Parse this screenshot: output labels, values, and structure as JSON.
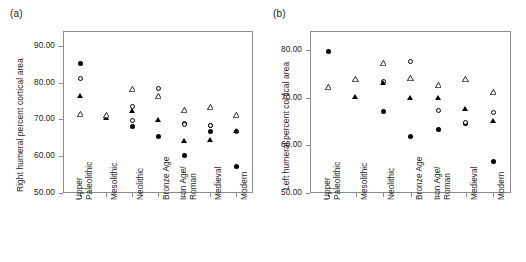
{
  "figure": {
    "panels": [
      {
        "id": "a",
        "label": "(a)",
        "ylabel": "Right humeral percent cortical area"
      },
      {
        "id": "b",
        "label": "(b)",
        "ylabel": "Left humeral percent cortical area"
      }
    ]
  },
  "chart_data": [
    {
      "type": "scatter",
      "panel": "a",
      "title": "(a)",
      "xlabel": "",
      "ylabel": "Right humeral percent cortical area",
      "ylim": [
        50.0,
        94.0
      ],
      "yticks": [
        50.0,
        60.0,
        70.0,
        80.0,
        90.0
      ],
      "ytick_labels": [
        "50.00",
        "60.00",
        "70.00",
        "80.00",
        "90.00"
      ],
      "grid": false,
      "legend": "none",
      "categories": [
        "Upper Paleolithic",
        "Mesolithic",
        "Neolithic",
        "Bronze Age",
        "Iron Age/ Roman",
        "Medieval",
        "Modern"
      ],
      "series": [
        {
          "name": "filled-circle",
          "marker": "filled-circle",
          "values": [
            85.1,
            null,
            68.0,
            65.3,
            60.1,
            66.8,
            57.2
          ]
        },
        {
          "name": "open-circle",
          "marker": "open-circle",
          "values": [
            81.1,
            null,
            69.8,
            78.3,
            68.9,
            68.2,
            66.6
          ]
        },
        {
          "name": "filled-triangle",
          "marker": "filled-triangle",
          "values": [
            76.2,
            70.3,
            72.3,
            69.7,
            64.2,
            64.3,
            66.8
          ]
        },
        {
          "name": "open-triangle",
          "marker": "open-triangle",
          "values": [
            71.3,
            71.1,
            78.1,
            76.3,
            72.4,
            73.2,
            71.1
          ]
        },
        {
          "name": "open-circle-secondary",
          "marker": "open-circle",
          "values": [
            null,
            null,
            73.4,
            null,
            68.6,
            68.3,
            null
          ]
        }
      ]
    },
    {
      "type": "scatter",
      "panel": "b",
      "title": "(b)",
      "xlabel": "",
      "ylabel": "Left humeral percent cortical area",
      "ylim": [
        50.0,
        84.0
      ],
      "yticks": [
        50.0,
        60.0,
        70.0,
        80.0
      ],
      "ytick_labels": [
        "50.00",
        "60.00",
        "70.00",
        "80.00"
      ],
      "grid": false,
      "legend": "none",
      "categories": [
        "Upper Paleolithic",
        "Mesolithic",
        "Neolithic",
        "Bronze Age",
        "Iron Age/ Roman",
        "Medieval",
        "Modern"
      ],
      "series": [
        {
          "name": "filled-circle",
          "marker": "filled-circle",
          "values": [
            79.8,
            null,
            67.2,
            61.8,
            63.4,
            64.5,
            56.7
          ]
        },
        {
          "name": "open-circle",
          "marker": "open-circle",
          "values": [
            null,
            null,
            73.5,
            77.5,
            67.4,
            64.7,
            67.0
          ]
        },
        {
          "name": "filled-triangle",
          "marker": "filled-triangle",
          "values": [
            null,
            70.1,
            73.0,
            69.8,
            69.9,
            67.5,
            65.0
          ]
        },
        {
          "name": "open-triangle",
          "marker": "open-triangle",
          "values": [
            72.1,
            73.8,
            77.3,
            74.0,
            72.6,
            73.9,
            71.1
          ]
        }
      ]
    }
  ]
}
